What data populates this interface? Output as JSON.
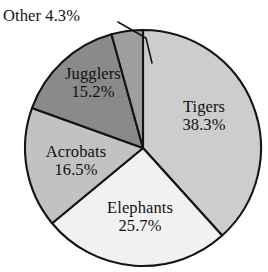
{
  "chart_data": {
    "type": "pie",
    "title": "",
    "categories": [
      "Tigers",
      "Elephants",
      "Acrobats",
      "Jugglers",
      "Other"
    ],
    "values": [
      38.3,
      25.7,
      16.5,
      15.2,
      4.3
    ],
    "value_suffix": "%",
    "legend": "none",
    "labels_inside": true,
    "slices": [
      {
        "name": "Tigers",
        "value": 38.3,
        "label": "Tigers",
        "value_text": "38.3%",
        "color": "#cdcdcd",
        "start_angle": 0,
        "end_angle": 137.88,
        "label_position": "inside"
      },
      {
        "name": "Elephants",
        "value": 25.7,
        "label": "Elephants",
        "value_text": "25.7%",
        "color": "#f1f1f1",
        "start_angle": 137.88,
        "end_angle": 230.4,
        "label_position": "inside"
      },
      {
        "name": "Acrobats",
        "value": 16.5,
        "label": "Acrobats",
        "value_text": "16.5%",
        "color": "#c2c2c2",
        "start_angle": 230.4,
        "end_angle": 289.8,
        "label_position": "inside"
      },
      {
        "name": "Jugglers",
        "value": 15.2,
        "label": "Jugglers",
        "value_text": "15.2%",
        "color": "#8a8a8a",
        "start_angle": 289.8,
        "end_angle": 344.52,
        "label_position": "inside"
      },
      {
        "name": "Other",
        "value": 4.3,
        "label": "Other",
        "value_text": "4.3%",
        "label_inline": "Other 4.3%",
        "color": "#9e9e9e",
        "start_angle": 344.52,
        "end_angle": 360,
        "label_position": "outside-callout"
      }
    ],
    "outline_color": "#141414",
    "background": "#ffffff"
  }
}
